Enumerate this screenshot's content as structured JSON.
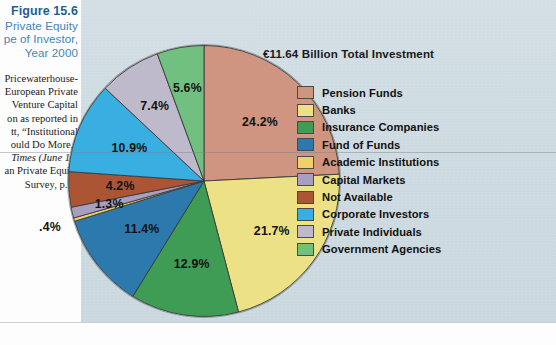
{
  "caption": {
    "figure_number": "Figure 15.6",
    "title_lines": [
      "Private Equity",
      "pe of Investor,",
      "Year 2000"
    ],
    "source_lines": [
      "Pricewaterhouse-",
      "European Private",
      "Venture Capital",
      "on as reported in",
      "tt, “Institutional",
      "ould Do More,”",
      "Times (June 14,",
      "an Private Equity",
      "Survey, p. 5."
    ],
    "source_italic_line_index": 6
  },
  "chart_data": {
    "type": "pie",
    "title": "€11.64 Billion Total Investment",
    "total_label": "€11.64 Billion Total Investment",
    "unit": "percent",
    "legend_position": "right",
    "categories": [
      "Pension Funds",
      "Banks",
      "Insurance Companies",
      "Fund of Funds",
      "Academic Institutions",
      "Capital Markets",
      "Not Available",
      "Corporate Investors",
      "Private Individuals",
      "Government Agencies"
    ],
    "values": [
      24.2,
      21.7,
      12.9,
      11.4,
      0.4,
      1.3,
      4.2,
      10.9,
      7.4,
      5.6
    ],
    "value_labels": [
      "24.2%",
      "21.7%",
      "12.9%",
      "11.4%",
      ".4%",
      "1.3%",
      "4.2%",
      "10.9%",
      "7.4%",
      "5.6%"
    ],
    "colors": [
      "#cf9580",
      "#ece184",
      "#3f9c55",
      "#2b79ad",
      "#efd16a",
      "#a89ec2",
      "#ab5535",
      "#39aee0",
      "#bfbacb",
      "#72c07f"
    ],
    "start_angle_deg": 0,
    "direction": "clockwise",
    "slices": [
      {
        "label": "Pension Funds",
        "value": 24.2,
        "display": "24.2%",
        "color": "#cf9580"
      },
      {
        "label": "Banks",
        "value": 21.7,
        "display": "21.7%",
        "color": "#ece184"
      },
      {
        "label": "Insurance Companies",
        "value": 12.9,
        "display": "12.9%",
        "color": "#3f9c55"
      },
      {
        "label": "Fund of Funds",
        "value": 11.4,
        "display": "11.4%",
        "color": "#2b79ad"
      },
      {
        "label": "Academic Institutions",
        "value": 0.4,
        "display": ".4%",
        "color": "#efd16a"
      },
      {
        "label": "Capital Markets",
        "value": 1.3,
        "display": "1.3%",
        "color": "#a89ec2"
      },
      {
        "label": "Not Available",
        "value": 4.2,
        "display": "4.2%",
        "color": "#ab5535"
      },
      {
        "label": "Corporate Investors",
        "value": 10.9,
        "display": "10.9%",
        "color": "#39aee0"
      },
      {
        "label": "Private Individuals",
        "value": 7.4,
        "display": "7.4%",
        "color": "#bfbacb"
      },
      {
        "label": "Government Agencies",
        "value": 5.6,
        "display": "5.6%",
        "color": "#72c07f"
      }
    ]
  },
  "theme": {
    "panel_background": "#cfdce2",
    "page_background": "#ffffff",
    "figure_number_color": "#1d5f92",
    "caption_color": "#3f86b8",
    "text_color": "#111111"
  }
}
